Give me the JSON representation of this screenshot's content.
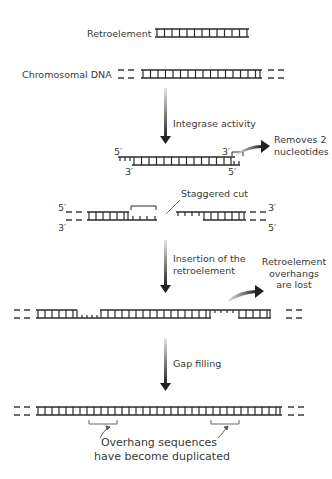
{
  "diagram": {
    "legend": {
      "retroelement_label": "Retroelement",
      "chromosomal_label": "Chromosomal DNA"
    },
    "steps": [
      {
        "arrow_label": "Integrase activity",
        "side_note": "Removes 2\nnucleotides"
      },
      {
        "callout": "Staggered cut"
      },
      {
        "arrow_label": "Insertion of the\nretroelement",
        "side_note": "Retroelement\noverhangs\nare lost"
      },
      {
        "arrow_label": "Gap filling"
      },
      {
        "callout": "Overhang sequences\nhave become duplicated"
      }
    ],
    "primes": {
      "five": "5′",
      "three": "3′"
    },
    "colors": {
      "ink": "#2b2b2b",
      "text": "#3a3a3a",
      "arrow_dark": "#222222",
      "arrow_light": "#dddddd"
    }
  }
}
